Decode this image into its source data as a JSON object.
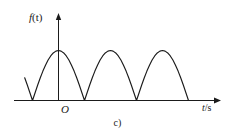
{
  "figure": {
    "caption": "c)",
    "background_color": "#ffffff",
    "line_color": "#1b1b1b"
  },
  "chart_data": {
    "type": "line",
    "title": "",
    "subtitle": "",
    "xlabel": "t/s",
    "ylabel": "f(t)",
    "ylabel_symbol": "f",
    "ylabel_arg": "(t)",
    "xlabel_symbol": "t",
    "xlabel_unit": "/s",
    "origin_label": "O",
    "grid": false,
    "legend": null,
    "annotations": [
      "c)"
    ],
    "function": "A*|sin(pi*t/T)|",
    "amplitude": 1,
    "half_period": 1,
    "xlim": [
      -0.65,
      3.2
    ],
    "ylim": [
      0,
      1.25
    ],
    "axis_arrow_x": true,
    "axis_arrow_y": true,
    "zero_crossings": [
      -0.5,
      0.5,
      1.5,
      2.5
    ],
    "peaks_x": [
      0,
      1,
      2
    ],
    "peaks_y": [
      1,
      1,
      1
    ],
    "x": [
      -0.65,
      -0.6,
      -0.55,
      -0.5,
      -0.45,
      -0.4,
      -0.35,
      -0.3,
      -0.25,
      -0.2,
      -0.15,
      -0.1,
      -0.05,
      0,
      0.05,
      0.1,
      0.15,
      0.2,
      0.25,
      0.3,
      0.35,
      0.4,
      0.45,
      0.5,
      0.55,
      0.6,
      0.65,
      0.7,
      0.75,
      0.8,
      0.85,
      0.9,
      0.95,
      1,
      1.05,
      1.1,
      1.15,
      1.2,
      1.25,
      1.3,
      1.35,
      1.4,
      1.45,
      1.5,
      1.55,
      1.6,
      1.65,
      1.7,
      1.75,
      1.8,
      1.85,
      1.9,
      1.95,
      2,
      2.05,
      2.1,
      2.15,
      2.2,
      2.25,
      2.3,
      2.35,
      2.4,
      2.45,
      2.5
    ],
    "y": [
      0.454,
      0.309,
      0.156,
      0,
      0.156,
      0.309,
      0.454,
      0.588,
      0.707,
      0.809,
      0.891,
      0.951,
      0.988,
      1,
      0.988,
      0.951,
      0.891,
      0.809,
      0.707,
      0.588,
      0.454,
      0.309,
      0.156,
      0,
      0.156,
      0.309,
      0.454,
      0.588,
      0.707,
      0.809,
      0.891,
      0.951,
      0.988,
      1,
      0.988,
      0.951,
      0.891,
      0.809,
      0.707,
      0.588,
      0.454,
      0.309,
      0.156,
      0,
      0.156,
      0.309,
      0.454,
      0.588,
      0.707,
      0.809,
      0.891,
      0.951,
      0.988,
      1,
      0.988,
      0.951,
      0.891,
      0.809,
      0.707,
      0.588,
      0.454,
      0.309,
      0.156,
      0
    ]
  }
}
